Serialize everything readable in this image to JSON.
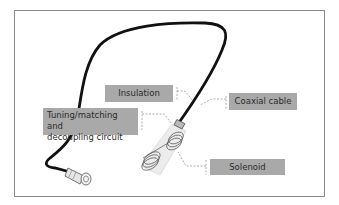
{
  "diagram": {
    "type": "labeled-illustration",
    "labels": {
      "insulation": "Insulation",
      "coaxial_cable": "Coaxial cable",
      "tuning_line1": "Tuning/matching and",
      "tuning_line2": "decoupling circuit",
      "solenoid": "Solenoid"
    },
    "colors": {
      "label_bg": "#a9a9a9",
      "label_text": "#2b2b2b",
      "cable": "#111111",
      "leader_line": "#777777",
      "frame": "#8a8a8a"
    }
  }
}
